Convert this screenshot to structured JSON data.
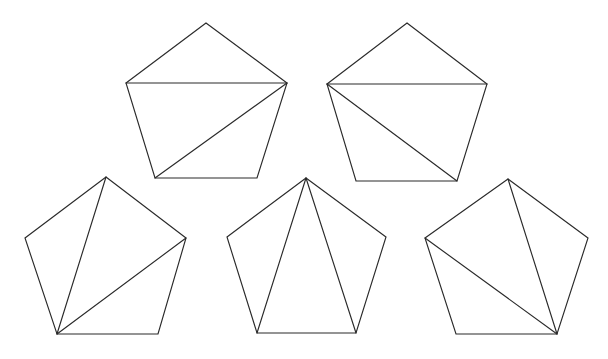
{
  "figure": {
    "background_color": "#ffffff",
    "stroke_color": "#2a2a2a",
    "stroke_width": 1.15,
    "canvas": {
      "width": 608,
      "height": 359
    },
    "shape_kind": "pentagon",
    "count": 5,
    "shapes": [
      {
        "id": "pentagon-1",
        "label": "top-left pentagon",
        "row": 1,
        "column": 1,
        "vertices": {
          "top": [
            206,
            23
          ],
          "left": [
            126,
            83
          ],
          "right": [
            287,
            83
          ],
          "bottom_left": [
            155,
            178
          ],
          "bottom_right": [
            257,
            178
          ]
        },
        "outline_points": "206,23 287,83 257,178 155,178 126,83",
        "diagonals": [
          {
            "name": "right-to-left",
            "from": "right",
            "to": "left",
            "x1": 287,
            "y1": 83,
            "x2": 126,
            "y2": 83
          },
          {
            "name": "right-to-bottom-left",
            "from": "right",
            "to": "bottom_left",
            "x1": 287,
            "y1": 83,
            "x2": 155,
            "y2": 178
          }
        ],
        "fan_apex": "right"
      },
      {
        "id": "pentagon-2",
        "label": "top-right pentagon",
        "row": 1,
        "column": 2,
        "vertices": {
          "top": [
            407,
            23
          ],
          "left": [
            327,
            84
          ],
          "right": [
            487,
            84
          ],
          "bottom_left": [
            356,
            181
          ],
          "bottom_right": [
            457,
            181
          ]
        },
        "outline_points": "407,23 487,84 457,181 356,181 327,84",
        "diagonals": [
          {
            "name": "left-to-right",
            "from": "left",
            "to": "right",
            "x1": 327,
            "y1": 84,
            "x2": 487,
            "y2": 84
          },
          {
            "name": "left-to-bottom-right",
            "from": "left",
            "to": "bottom_right",
            "x1": 327,
            "y1": 84,
            "x2": 457,
            "y2": 181
          }
        ],
        "fan_apex": "left"
      },
      {
        "id": "pentagon-3",
        "label": "bottom-left pentagon",
        "row": 2,
        "column": 1,
        "vertices": {
          "top": [
            106,
            177
          ],
          "left": [
            25,
            238
          ],
          "right": [
            186,
            238
          ],
          "bottom_left": [
            57,
            334
          ],
          "bottom_right": [
            158,
            334
          ]
        },
        "outline_points": "106,177 186,238 158,334 57,334 25,238",
        "diagonals": [
          {
            "name": "bottom-left-to-top",
            "from": "bottom_left",
            "to": "top",
            "x1": 57,
            "y1": 334,
            "x2": 106,
            "y2": 177
          },
          {
            "name": "bottom-left-to-right",
            "from": "bottom_left",
            "to": "right",
            "x1": 57,
            "y1": 334,
            "x2": 186,
            "y2": 238
          }
        ],
        "fan_apex": "bottom_left"
      },
      {
        "id": "pentagon-4",
        "label": "bottom-middle pentagon",
        "row": 2,
        "column": 2,
        "vertices": {
          "top": [
            306,
            178
          ],
          "left": [
            227,
            237
          ],
          "right": [
            386,
            237
          ],
          "bottom_left": [
            257,
            333
          ],
          "bottom_right": [
            356,
            333
          ]
        },
        "outline_points": "306,178 386,237 356,333 257,333 227,237",
        "diagonals": [
          {
            "name": "top-to-bottom-left",
            "from": "top",
            "to": "bottom_left",
            "x1": 306,
            "y1": 178,
            "x2": 257,
            "y2": 333
          },
          {
            "name": "top-to-bottom-right",
            "from": "top",
            "to": "bottom_right",
            "x1": 306,
            "y1": 178,
            "x2": 356,
            "y2": 333
          }
        ],
        "fan_apex": "top"
      },
      {
        "id": "pentagon-5",
        "label": "bottom-right pentagon",
        "row": 2,
        "column": 3,
        "vertices": {
          "top": [
            508,
            179
          ],
          "left": [
            425,
            238
          ],
          "right": [
            588,
            238
          ],
          "bottom_left": [
            456,
            334
          ],
          "bottom_right": [
            557,
            334
          ]
        },
        "outline_points": "508,179 588,238 557,334 456,334 425,238",
        "diagonals": [
          {
            "name": "bottom-right-to-top",
            "from": "bottom_right",
            "to": "top",
            "x1": 557,
            "y1": 334,
            "x2": 508,
            "y2": 179
          },
          {
            "name": "bottom-right-to-left",
            "from": "bottom_right",
            "to": "left",
            "x1": 557,
            "y1": 334,
            "x2": 425,
            "y2": 238
          }
        ],
        "fan_apex": "bottom_right"
      }
    ]
  }
}
